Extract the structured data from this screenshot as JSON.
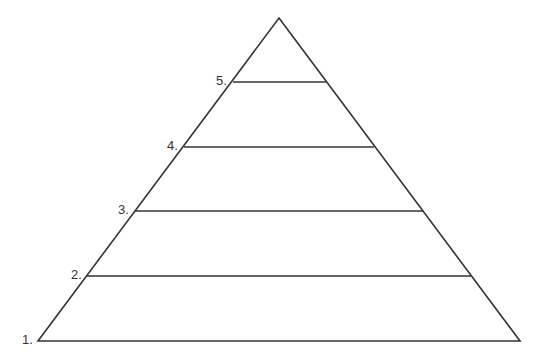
{
  "diagram": {
    "type": "pyramid",
    "levels": 5,
    "labels": [
      "1.",
      "2.",
      "3.",
      "4.",
      "5."
    ],
    "stroke_color": "#333333",
    "background": "#ffffff"
  }
}
